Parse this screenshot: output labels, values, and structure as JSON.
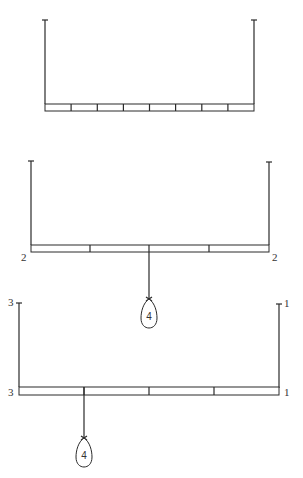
{
  "colors": {
    "ink": "#2a2a2a",
    "background": "#ffffff"
  },
  "diagrams": [
    {
      "name": "uniform-beam-8-segments",
      "segments": 8,
      "left_label": "",
      "right_label": ""
    },
    {
      "name": "beam-with-center-weight",
      "segments": 3,
      "left_label": "2",
      "right_label": "2",
      "weight": {
        "label": "4",
        "position": "center"
      }
    },
    {
      "name": "beam-with-offset-weight",
      "segments": 4,
      "left_top_label": "3",
      "left_label": "3",
      "right_top_label": "1",
      "right_label": "1",
      "weight": {
        "label": "4",
        "position": "quarter-from-left"
      }
    }
  ]
}
